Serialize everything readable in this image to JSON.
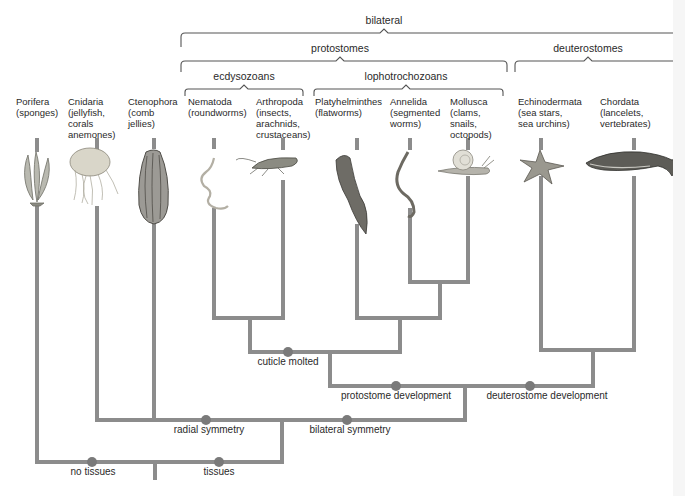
{
  "diagram": {
    "type": "phylogenetic-tree",
    "colors": {
      "branch": "#8c8c8c",
      "node_dot": "#7a7a7a",
      "bracket": "#555555",
      "text": "#2a2a2a"
    },
    "groups": {
      "bilateral": "bilateral",
      "protostomes": "protostomes",
      "deuterostomes": "deuterostomes",
      "ecdysozoans": "ecdysozoans",
      "lophotrochozoans": "lophotrochozoans"
    },
    "taxa": [
      {
        "name": "Porifera",
        "examples": [
          "(sponges)"
        ],
        "icon": "sponge-icon"
      },
      {
        "name": "Cnidaria",
        "examples": [
          "(jellyfish,",
          "corals",
          "anemones)"
        ],
        "icon": "jellyfish-icon"
      },
      {
        "name": "Ctenophora",
        "examples": [
          "(comb",
          "jellies)"
        ],
        "icon": "comb-jelly-icon"
      },
      {
        "name": "Nematoda",
        "examples": [
          "(roundworms)"
        ],
        "icon": "roundworm-icon"
      },
      {
        "name": "Arthropoda",
        "examples": [
          "(insects,",
          "arachnids,",
          "crustaceans)"
        ],
        "icon": "grasshopper-icon"
      },
      {
        "name": "Platyhelminthes",
        "examples": [
          "(flatworms)"
        ],
        "icon": "flatworm-icon"
      },
      {
        "name": "Annelida",
        "examples": [
          "(segmented",
          "worms)"
        ],
        "icon": "segmented-worm-icon"
      },
      {
        "name": "Mollusca",
        "examples": [
          "(clams,",
          "snails,",
          "octopods)"
        ],
        "icon": "snail-icon"
      },
      {
        "name": "Echinodermata",
        "examples": [
          "(sea stars,",
          "sea urchins)"
        ],
        "icon": "sea-star-icon"
      },
      {
        "name": "Chordata",
        "examples": [
          "(lancelets,",
          "vertebrates)"
        ],
        "icon": "whale-icon"
      }
    ],
    "characters": {
      "cuticle_molted": "cuticle molted",
      "protostome_development": "protostome development",
      "deuterostome_development": "deuterostome development",
      "radial_symmetry": "radial symmetry",
      "bilateral_symmetry": "bilateral symmetry",
      "no_tissues": "no tissues",
      "tissues": "tissues"
    }
  }
}
